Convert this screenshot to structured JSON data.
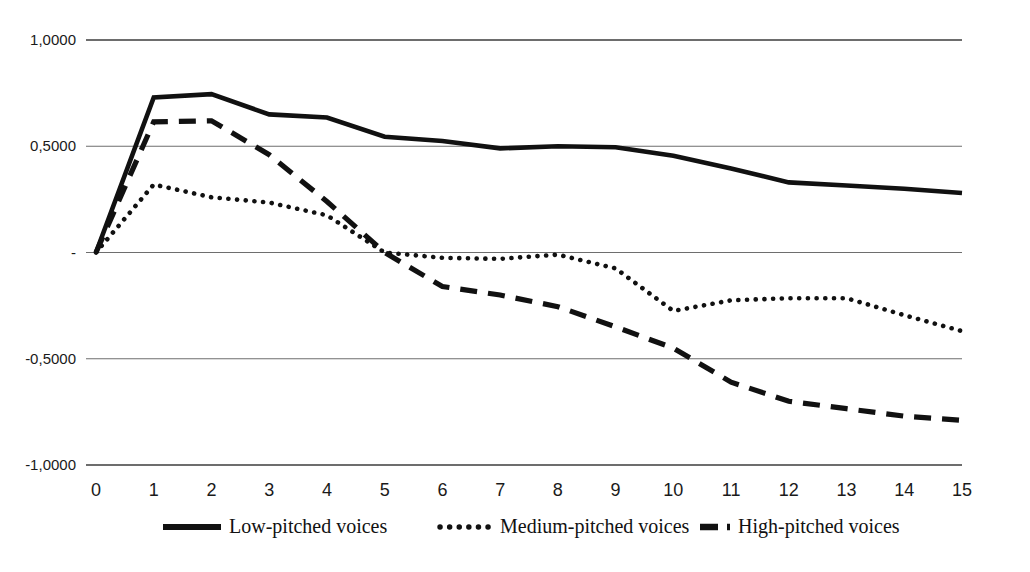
{
  "chart_data": {
    "type": "line",
    "title": "",
    "subtitle": "",
    "xlabel": "",
    "ylabel": "",
    "xlim": [
      0,
      15
    ],
    "ylim": [
      -1.0,
      1.0
    ],
    "grid": true,
    "gridlines_y": [
      1.0,
      0.5,
      0.0,
      -0.5,
      -1.0
    ],
    "legend_position": "bottom",
    "decimal_separator": ",",
    "x": [
      0,
      1,
      2,
      3,
      4,
      5,
      6,
      7,
      8,
      9,
      10,
      11,
      12,
      13,
      14,
      15
    ],
    "x_tick_labels": [
      "0",
      "1",
      "2",
      "3",
      "4",
      "5",
      "6",
      "7",
      "8",
      "9",
      "10",
      "11",
      "12",
      "13",
      "14",
      "15"
    ],
    "y_tick_labels": [
      "1,0000",
      "0,5000",
      "-",
      "-0,5000",
      "-1,0000"
    ],
    "y_tick_values": [
      1.0,
      0.5,
      0.0,
      -0.5,
      -1.0
    ],
    "series": [
      {
        "name": "Low-pitched voices",
        "style": "solid",
        "color": "#111111",
        "values": [
          0.0,
          0.73,
          0.745,
          0.65,
          0.635,
          0.545,
          0.525,
          0.49,
          0.5,
          0.495,
          0.455,
          0.395,
          0.33,
          0.315,
          0.3,
          0.28
        ]
      },
      {
        "name": "Medium-pitched voices",
        "style": "dotted",
        "color": "#111111",
        "values": [
          0.0,
          0.32,
          0.26,
          0.235,
          0.175,
          0.0,
          -0.025,
          -0.03,
          -0.01,
          -0.075,
          -0.275,
          -0.225,
          -0.215,
          -0.215,
          -0.295,
          -0.37
        ]
      },
      {
        "name": "High-pitched voices",
        "style": "dashed",
        "color": "#111111",
        "values": [
          0.0,
          0.615,
          0.62,
          0.46,
          0.24,
          0.0,
          -0.16,
          -0.2,
          -0.255,
          -0.35,
          -0.45,
          -0.61,
          -0.7,
          -0.735,
          -0.77,
          -0.79
        ]
      }
    ]
  },
  "legend": {
    "items": [
      {
        "label": "Low-pitched voices",
        "swatch": "solid-line-swatch"
      },
      {
        "label": "Medium-pitched voices",
        "swatch": "dotted-line-swatch"
      },
      {
        "label": "High-pitched voices",
        "swatch": "dashed-line-swatch"
      }
    ]
  }
}
